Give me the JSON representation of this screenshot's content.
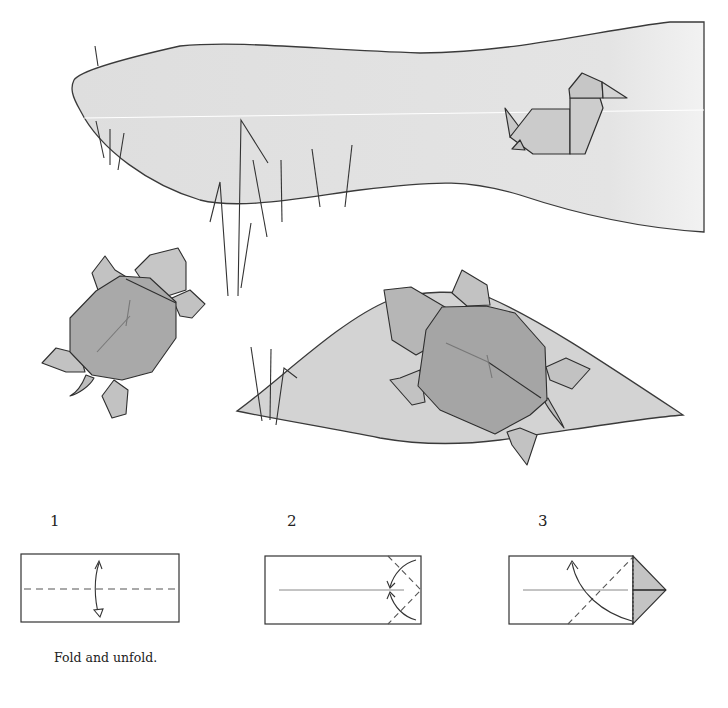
{
  "illustration": {
    "description": "Origami turtles and duck scene",
    "colors": {
      "water_fill": "#e2e2e2",
      "land_fill": "#d2d2d2",
      "shell_fill": "#a8a8a8",
      "limb_fill": "#c4c4c4",
      "duck_fill": "#cbcbcb",
      "stroke": "#3a3a3a"
    }
  },
  "steps": [
    {
      "number": "1",
      "caption": "Fold and unfold."
    },
    {
      "number": "2",
      "caption": ""
    },
    {
      "number": "3",
      "caption": ""
    }
  ]
}
